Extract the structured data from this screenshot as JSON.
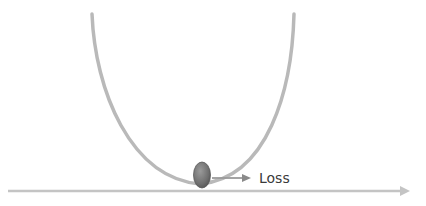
{
  "diagram": {
    "title": "",
    "loss_label": "Loss",
    "colors": {
      "curve": "#b9b9b9",
      "axis": "#c4c4c4",
      "ball_fill": "#7a7a7a",
      "ball_edge": "#5a5a5a",
      "pointer_arrow": "#9a9a9a",
      "label": "#3a3a3a"
    },
    "elements": [
      {
        "id": "loss-curve",
        "kind": "parabola",
        "description": "U-shaped loss curve"
      },
      {
        "id": "ball",
        "kind": "ellipse",
        "description": "ball resting at minimum of curve"
      },
      {
        "id": "pointer-arrow",
        "kind": "arrow",
        "description": "arrow pointing from ball to label"
      },
      {
        "id": "horizontal-axis",
        "kind": "arrow",
        "description": "horizontal axis arrow"
      }
    ]
  }
}
